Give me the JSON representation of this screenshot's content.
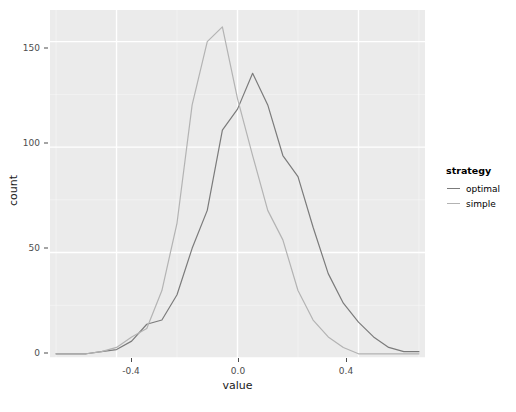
{
  "chart_data": {
    "type": "line",
    "title": "",
    "xlabel": "value",
    "ylabel": "count",
    "xlim": [
      -0.62,
      0.62
    ],
    "ylim": [
      0,
      165
    ],
    "xticks": [
      -0.4,
      0.0,
      0.4
    ],
    "xtick_labels": [
      "-0.4",
      "0.0",
      "0.4"
    ],
    "yticks": [
      0,
      50,
      100,
      150
    ],
    "ytick_labels": [
      "0",
      "50",
      "100",
      "150"
    ],
    "grid": true,
    "legend_position": "right",
    "legend_title": "strategy",
    "series": [
      {
        "name": "optimal",
        "color": "#7b7b7b",
        "x": [
          -0.6,
          -0.55,
          -0.5,
          -0.45,
          -0.4,
          -0.35,
          -0.3,
          -0.25,
          -0.2,
          -0.15,
          -0.1,
          -0.05,
          0.0,
          0.05,
          0.1,
          0.15,
          0.2,
          0.25,
          0.3,
          0.35,
          0.4,
          0.45,
          0.5,
          0.55,
          0.6
        ],
        "y": [
          2,
          2,
          2,
          3,
          4,
          8,
          16,
          18,
          30,
          52,
          70,
          108,
          118,
          135,
          120,
          96,
          86,
          62,
          40,
          26,
          17,
          10,
          5,
          3,
          3
        ],
        "values": [
          2,
          2,
          2,
          3,
          4,
          8,
          16,
          18,
          30,
          52,
          70,
          108,
          118,
          135,
          120,
          96,
          86,
          62,
          40,
          26,
          17,
          10,
          5,
          3,
          3
        ]
      },
      {
        "name": "simple",
        "color": "#b3b3b3",
        "x": [
          -0.6,
          -0.55,
          -0.5,
          -0.45,
          -0.4,
          -0.35,
          -0.3,
          -0.25,
          -0.2,
          -0.15,
          -0.1,
          -0.05,
          0.0,
          0.05,
          0.1,
          0.15,
          0.2,
          0.25,
          0.3,
          0.35,
          0.4,
          0.45,
          0.5,
          0.55,
          0.6
        ],
        "y": [
          2,
          2,
          2,
          3,
          5,
          10,
          14,
          32,
          64,
          120,
          150,
          157,
          123,
          96,
          70,
          56,
          32,
          18,
          10,
          5,
          2,
          2,
          2,
          2,
          2
        ],
        "values": [
          2,
          2,
          2,
          3,
          5,
          10,
          14,
          32,
          64,
          120,
          150,
          157,
          123,
          96,
          70,
          56,
          32,
          18,
          10,
          5,
          2,
          2,
          2,
          2,
          2
        ]
      }
    ],
    "legend_entries": [
      {
        "label": "optimal",
        "color": "#7b7b7b"
      },
      {
        "label": "simple",
        "color": "#b3b3b3"
      }
    ],
    "panel_background": "#ebebeb",
    "gridline_color": "#ffffff"
  }
}
